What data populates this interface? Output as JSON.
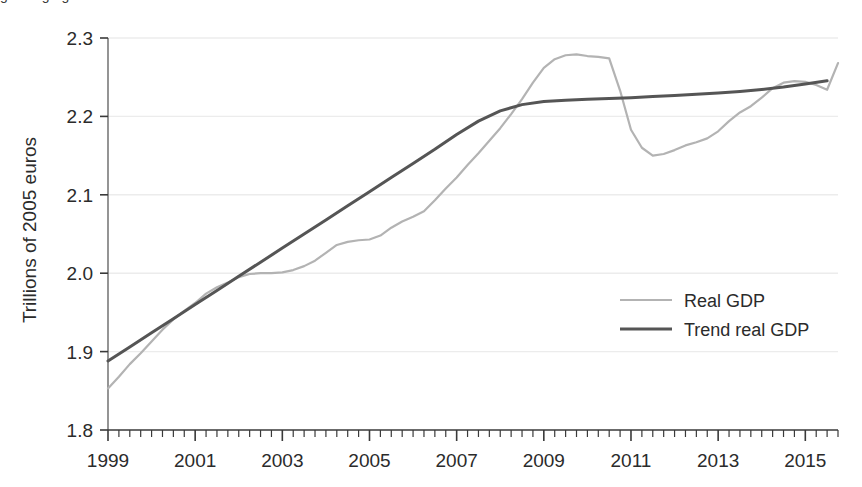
{
  "figure": {
    "caption_partial": "growing again",
    "background_color": "#ffffff"
  },
  "chart_data": {
    "type": "line",
    "title": "",
    "subtitle": "",
    "xlabel": "",
    "ylabel": "Trillions of 2005 euros",
    "xlim": [
      1999,
      2015.75
    ],
    "ylim": [
      1.8,
      2.3
    ],
    "grid": true,
    "grid_axis": "y",
    "legend_position": "center-right",
    "x_tick_labels": [
      "1999",
      "2001",
      "2003",
      "2005",
      "2007",
      "2009",
      "2011",
      "2013",
      "2015"
    ],
    "x_tick_values": [
      1999,
      2001,
      2003,
      2005,
      2007,
      2009,
      2011,
      2013,
      2015
    ],
    "x_minor_tick_interval": 0.25,
    "y_tick_labels": [
      "1.8",
      "1.9",
      "2.0",
      "2.1",
      "2.2",
      "2.3"
    ],
    "y_tick_values": [
      1.8,
      1.9,
      2.0,
      2.1,
      2.2,
      2.3
    ],
    "series": [
      {
        "name": "Real GDP",
        "color": "#b3b3b3",
        "line_width": 2.2,
        "x": [
          1999.0,
          1999.25,
          1999.5,
          1999.75,
          2000.0,
          2000.25,
          2000.5,
          2000.75,
          2001.0,
          2001.25,
          2001.5,
          2001.75,
          2002.0,
          2002.25,
          2002.5,
          2002.75,
          2003.0,
          2003.25,
          2003.5,
          2003.75,
          2004.0,
          2004.25,
          2004.5,
          2004.75,
          2005.0,
          2005.25,
          2005.5,
          2005.75,
          2006.0,
          2006.25,
          2006.5,
          2006.75,
          2007.0,
          2007.25,
          2007.5,
          2007.75,
          2008.0,
          2008.25,
          2008.5,
          2008.75,
          2009.0,
          2009.25,
          2009.5,
          2009.75,
          2010.0,
          2010.25,
          2010.5,
          2010.75,
          2011.0,
          2011.25,
          2011.5,
          2011.75,
          2012.0,
          2012.25,
          2012.5,
          2012.75,
          2013.0,
          2013.25,
          2013.5,
          2013.75,
          2014.0,
          2014.25,
          2014.5,
          2014.75,
          2015.0,
          2015.25,
          2015.5
        ],
        "y": [
          1.853,
          1.868,
          1.884,
          1.898,
          1.913,
          1.928,
          1.941,
          1.952,
          1.962,
          1.974,
          1.982,
          1.988,
          1.995,
          1.999,
          2.0,
          2.0,
          2.001,
          2.004,
          2.009,
          2.016,
          2.026,
          2.036,
          2.04,
          2.042,
          2.043,
          2.048,
          2.058,
          2.066,
          2.072,
          2.079,
          2.093,
          2.108,
          2.122,
          2.138,
          2.153,
          2.169,
          2.185,
          2.203,
          2.222,
          2.243,
          2.262,
          2.273,
          2.278,
          2.279,
          2.277,
          2.276,
          2.274,
          2.233,
          2.183,
          2.16,
          2.15,
          2.152,
          2.157,
          2.163,
          2.167,
          2.172,
          2.181,
          2.194,
          2.205,
          2.213,
          2.224,
          2.236,
          2.243,
          2.245,
          2.244,
          2.24,
          2.234
        ]
      },
      {
        "name": "Trend real GDP",
        "color": "#555555",
        "line_width": 3.0,
        "x": [
          1999.0,
          1999.5,
          2000.0,
          2000.5,
          2001.0,
          2001.5,
          2002.0,
          2002.5,
          2003.0,
          2003.5,
          2004.0,
          2004.5,
          2005.0,
          2005.5,
          2006.0,
          2006.5,
          2007.0,
          2007.5,
          2008.0,
          2008.5,
          2009.0,
          2009.5,
          2010.0,
          2010.5,
          2011.0,
          2011.5,
          2012.0,
          2012.5,
          2013.0,
          2013.5,
          2014.0,
          2014.5,
          2015.0,
          2015.5
        ],
        "y": [
          1.888,
          1.906,
          1.924,
          1.942,
          1.96,
          1.978,
          1.996,
          2.014,
          2.032,
          2.05,
          2.068,
          2.086,
          2.104,
          2.122,
          2.14,
          2.158,
          2.177,
          2.194,
          2.207,
          2.215,
          2.219,
          2.2205,
          2.2218,
          2.2229,
          2.2239,
          2.2253,
          2.2268,
          2.2283,
          2.2298,
          2.2318,
          2.2343,
          2.2374,
          2.2412,
          2.2455
        ]
      }
    ],
    "series_extended_tail": {
      "Real GDP": {
        "x": [
          2015.5,
          2015.75
        ],
        "y": [
          2.234,
          2.268
        ]
      }
    },
    "annotations": []
  },
  "legend": {
    "entries": [
      {
        "label": "Real GDP",
        "color": "#b3b3b3",
        "line_width": 2.2
      },
      {
        "label": "Trend real GDP",
        "color": "#555555",
        "line_width": 3.0
      }
    ]
  },
  "axes": {
    "spine_color": "#7a7a7a",
    "grid_color": "#ececec",
    "tick_color": "#555555",
    "label_color": "#2b2b2b"
  }
}
